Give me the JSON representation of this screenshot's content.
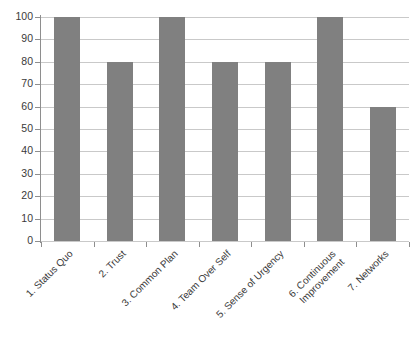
{
  "clipped_top_text": "",
  "chart_data": {
    "type": "bar",
    "title": "",
    "subtitle": "",
    "xlabel": "",
    "ylabel": "",
    "ylim": [
      0,
      100
    ],
    "y_ticks": [
      0,
      10,
      20,
      30,
      40,
      50,
      60,
      70,
      80,
      90,
      100
    ],
    "grid": true,
    "legend": false,
    "legend_position": "none",
    "bar_color": "#808080",
    "gridline_color": "#c9c9c9",
    "axis_color": "#8e8e8e",
    "background_color": "#ffffff",
    "categories": [
      "1. Status Quo",
      "2. Trust",
      "3. Common Plan",
      "4. Team Over Self",
      "5. Sense of Urgency",
      "6. Continuous Improvement",
      "7. Networks"
    ],
    "category_lines": [
      [
        "1. Status Quo"
      ],
      [
        "2. Trust"
      ],
      [
        "3. Common Plan"
      ],
      [
        "4. Team Over Self"
      ],
      [
        "5. Sense of Urgency"
      ],
      [
        "6. Continuous",
        "Improvement"
      ],
      [
        "7. Networks"
      ]
    ],
    "values": [
      100,
      80,
      100,
      80,
      80,
      100,
      60
    ]
  }
}
